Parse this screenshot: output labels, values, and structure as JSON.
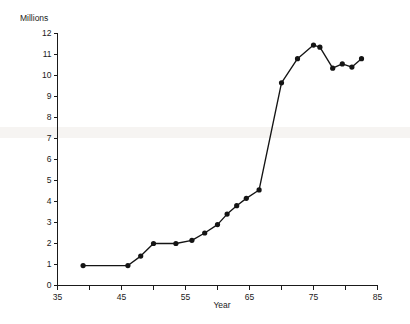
{
  "chart_data": {
    "type": "line",
    "title": "",
    "subtitle": "",
    "ylabel": "Millions",
    "xlabel": "Year",
    "xlim": [
      35,
      85
    ],
    "ylim": [
      0,
      12
    ],
    "xticks": [
      35,
      45,
      55,
      65,
      75,
      85
    ],
    "xtick_labels": [
      "35",
      "45",
      "55",
      "65",
      "75",
      "85"
    ],
    "xminor_ticks": [
      40,
      50,
      60,
      70,
      80
    ],
    "yticks": [
      0,
      1,
      2,
      3,
      4,
      5,
      6,
      7,
      8,
      9,
      10,
      11,
      12
    ],
    "ytick_labels": [
      "0",
      "1",
      "2",
      "3",
      "4",
      "5",
      "6",
      "7",
      "8",
      "9",
      "10",
      "11",
      "12"
    ],
    "grid": false,
    "legend": null,
    "marker": "filled-circle",
    "line_color": "#141414",
    "marker_color": "#141414",
    "axis_color": "#1a1a1a",
    "background_color": "#ffffff",
    "series": [
      {
        "name": "Millions",
        "points": [
          {
            "x": 39.0,
            "y": 0.95
          },
          {
            "x": 46.0,
            "y": 0.95
          },
          {
            "x": 48.0,
            "y": 1.4
          },
          {
            "x": 50.0,
            "y": 2.0
          },
          {
            "x": 53.5,
            "y": 2.0
          },
          {
            "x": 56.0,
            "y": 2.15
          },
          {
            "x": 58.0,
            "y": 2.5
          },
          {
            "x": 60.0,
            "y": 2.9
          },
          {
            "x": 61.5,
            "y": 3.4
          },
          {
            "x": 63.0,
            "y": 3.8
          },
          {
            "x": 64.5,
            "y": 4.15
          },
          {
            "x": 66.5,
            "y": 4.55
          },
          {
            "x": 70.0,
            "y": 9.65
          },
          {
            "x": 72.5,
            "y": 10.8
          },
          {
            "x": 75.0,
            "y": 11.45
          },
          {
            "x": 76.0,
            "y": 11.35
          },
          {
            "x": 78.0,
            "y": 10.35
          },
          {
            "x": 79.5,
            "y": 10.55
          },
          {
            "x": 81.0,
            "y": 10.4
          },
          {
            "x": 82.5,
            "y": 10.8
          }
        ]
      }
    ]
  }
}
